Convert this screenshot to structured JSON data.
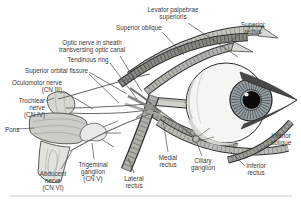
{
  "figure": {
    "type": "anatomical-illustration"
  },
  "colors": {
    "paper": "#ffffff",
    "ink": "#3a3a3a",
    "outline": "#2f2f2f",
    "muscle_light": "#c6c6c1",
    "muscle_mid": "#9b9b96",
    "iris": "#97a0a5",
    "pupil": "#0b0b0b"
  },
  "labels": {
    "levator": "Levator palpebrae\nsuperioris",
    "superior_oblique": "Superior oblique",
    "superior_rectus": "Superior\nrectus",
    "optic_nerve": "Optic nerve in sheath\ntransversing optic canal",
    "tendinous_ring": "Tendinous ring",
    "superior_orbital_fissure": "Superior orbital fissure",
    "oculomotor": "Oculomotor nerve\n(CN III)",
    "trochlear": "Trochlear\nnerve\n(CN IV)",
    "pons": "Pons",
    "abducent": "Abducent\nnerve\n(CN VI)",
    "trigeminal": "Trigeminal\nganglion\n(CN V)",
    "lateral_rectus": "Lateral\nrectus",
    "medial_rectus": "Medial\nrectus",
    "ciliary_ganglion": "Ciliary\nganglion",
    "inferior_rectus": "Inferior\nrectus",
    "inferior_oblique": "Inferior\noblique"
  }
}
